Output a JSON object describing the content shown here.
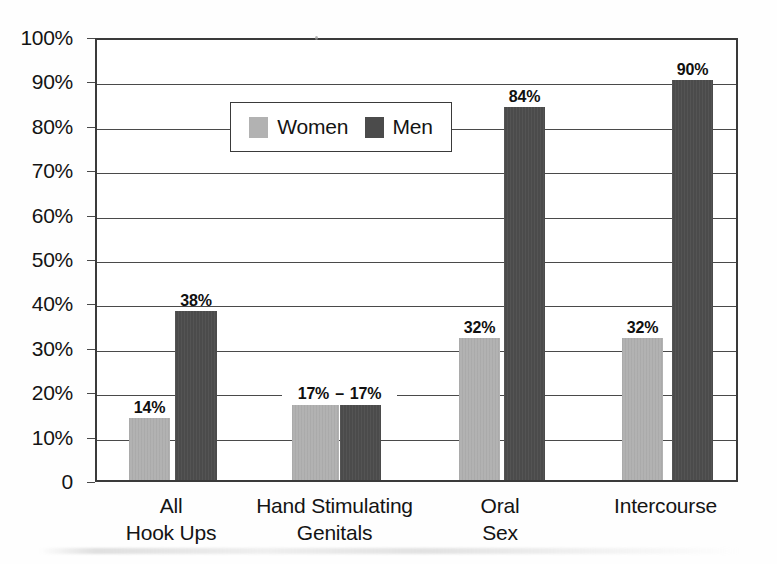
{
  "chart_data": {
    "type": "bar",
    "title": "",
    "subtitle": "",
    "xlabel": "",
    "ylabel": "",
    "ylim": [
      0,
      100
    ],
    "grid": true,
    "legend_position": "top-left-inside",
    "categories": [
      "All\nHook Ups",
      "Hand Stimulating\nGenitals",
      "Oral\nSex",
      "Intercourse"
    ],
    "category_lines": [
      [
        "All",
        "Hook Ups"
      ],
      [
        "Hand Stimulating",
        "Genitals"
      ],
      [
        "Oral",
        "Sex"
      ],
      [
        "Intercourse",
        ""
      ]
    ],
    "series": [
      {
        "name": "Women",
        "color": "#b2b2b2",
        "values": [
          14,
          17,
          32,
          32
        ]
      },
      {
        "name": "Men",
        "color": "#4b4b4b",
        "values": [
          38,
          17,
          84,
          90
        ]
      }
    ],
    "data_labels": {
      "women": [
        "14%",
        "17%",
        "32%",
        "32%"
      ],
      "men": [
        "38%",
        "17%",
        "84%",
        "90%"
      ]
    },
    "paired_label_separator": "–",
    "y_ticks": [
      {
        "value": 100,
        "label": "100%"
      },
      {
        "value": 90,
        "label": "90%"
      },
      {
        "value": 80,
        "label": "80%"
      },
      {
        "value": 70,
        "label": "70%"
      },
      {
        "value": 60,
        "label": "60%"
      },
      {
        "value": 50,
        "label": "50%"
      },
      {
        "value": 40,
        "label": "40%"
      },
      {
        "value": 30,
        "label": "30%"
      },
      {
        "value": 20,
        "label": "20%"
      },
      {
        "value": 10,
        "label": "10%"
      },
      {
        "value": 0,
        "label": "0"
      }
    ]
  },
  "legend": {
    "entries": [
      {
        "label": "Women",
        "swatch": "women"
      },
      {
        "label": "Men",
        "swatch": "men"
      }
    ]
  },
  "colors": {
    "women": "#b2b2b2",
    "men": "#4b4b4b",
    "axis": "#3a3a3a",
    "grid": "#4a4a4a",
    "text": "#141414",
    "background": "#ffffff"
  }
}
